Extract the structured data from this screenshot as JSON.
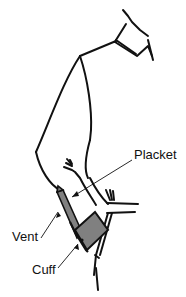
{
  "diagram": {
    "labels": [
      {
        "id": "placket",
        "text": "Placket",
        "x": 134,
        "y": 154
      },
      {
        "id": "vent",
        "text": "Vent",
        "x": 12,
        "y": 232
      },
      {
        "id": "cuff",
        "text": "Cuff",
        "x": 32,
        "y": 264
      }
    ],
    "colors": {
      "line": "#111111",
      "fill_gray": "#808080",
      "background": "#ffffff"
    }
  }
}
